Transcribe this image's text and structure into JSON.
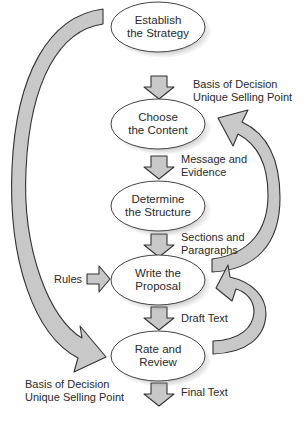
{
  "diagram": {
    "type": "process-flow",
    "colors": {
      "arrow_fill": "#c8c8c8",
      "stroke": "#333333",
      "node_fill": "#ffffff",
      "text": "#2a2a2a"
    },
    "nodes": [
      {
        "id": "strategy",
        "line1": "Establish",
        "line2": "the Strategy"
      },
      {
        "id": "content",
        "line1": "Choose",
        "line2": "the Content"
      },
      {
        "id": "structure",
        "line1": "Determine",
        "line2": "the Structure"
      },
      {
        "id": "write",
        "line1": "Write the",
        "line2": "Proposal"
      },
      {
        "id": "review",
        "line1": "Rate and",
        "line2": "Review"
      }
    ],
    "flow_labels": [
      {
        "between": "strategy-content",
        "line1": "Basis of Decision",
        "line2": "Unique Selling Point"
      },
      {
        "between": "content-structure",
        "line1": "Message and",
        "line2": "Evidence"
      },
      {
        "between": "structure-write",
        "line1": "Sections and",
        "line2": "Paragraphs"
      },
      {
        "between": "write-review",
        "line1": "Draft Text"
      },
      {
        "between": "review-out",
        "line1": "Final Text"
      }
    ],
    "input_label": "Rules",
    "feedback_label": {
      "line1": "Basis of Decision",
      "line2": "Unique Selling Point"
    },
    "edges": [
      {
        "from": "strategy",
        "to": "content"
      },
      {
        "from": "content",
        "to": "structure"
      },
      {
        "from": "structure",
        "to": "write"
      },
      {
        "from": "write",
        "to": "review"
      },
      {
        "from": "review",
        "to": "output"
      },
      {
        "from": "rules",
        "to": "write"
      },
      {
        "from": "strategy",
        "to": "review",
        "kind": "curved-left"
      },
      {
        "from": "write",
        "to": "content",
        "kind": "curved-right-loop"
      },
      {
        "from": "review",
        "to": "write",
        "kind": "curved-right-loop"
      }
    ]
  }
}
